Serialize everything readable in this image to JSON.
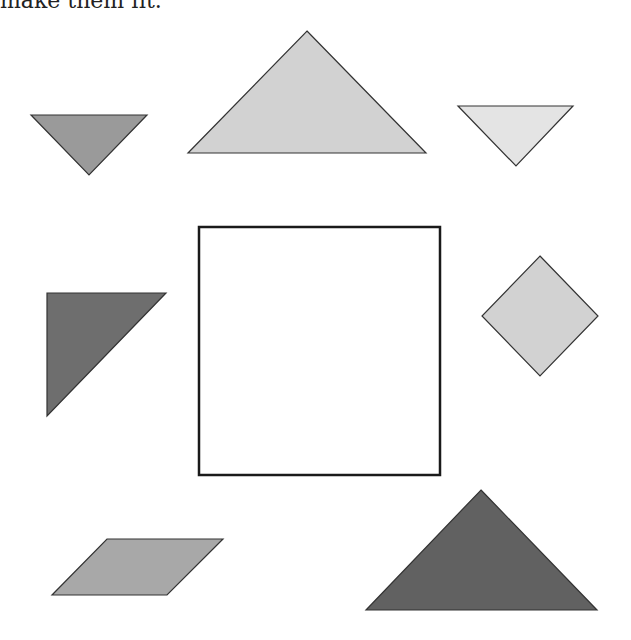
{
  "caption": "make them fit.",
  "canvas": {
    "width": 631,
    "height": 640
  },
  "target_square": {
    "label": "target-square-outline",
    "x": 199,
    "y": 227,
    "width": 241,
    "height": 248,
    "stroke": "#1a1a1a",
    "stroke_width": 2.5,
    "fill": "#ffffff"
  },
  "pieces": [
    {
      "name": "small-triangle-mid-gray",
      "shape": "triangle",
      "points": "31,115 147,115 89,175",
      "fill": "#9a9a9a"
    },
    {
      "name": "large-triangle-light-gray",
      "shape": "triangle",
      "points": "307,31 426,153 188,153",
      "fill": "#d2d2d2"
    },
    {
      "name": "small-triangle-lightest-gray",
      "shape": "triangle",
      "points": "458,106 573,106 516,166",
      "fill": "#e4e4e4"
    },
    {
      "name": "medium-triangle-dark-gray",
      "shape": "triangle",
      "points": "47,293 166,293 47,416",
      "fill": "#6e6e6e"
    },
    {
      "name": "square-diamond-light-gray",
      "shape": "square",
      "points": "540,256 598,316 540,376 482,316",
      "fill": "#d2d2d2"
    },
    {
      "name": "parallelogram-gray",
      "shape": "parallelogram",
      "points": "107,539 223,539 167,595 52,595",
      "fill": "#a8a8a8"
    },
    {
      "name": "large-triangle-darkest-gray",
      "shape": "triangle",
      "points": "481,490 597,610 366,610",
      "fill": "#616161"
    }
  ],
  "piece_stroke": "#333333"
}
